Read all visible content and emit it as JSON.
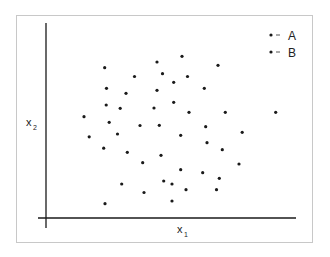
{
  "chart_data": {
    "type": "scatter",
    "title": "",
    "xlabel": "x",
    "xlabel_sub": "1",
    "ylabel": "x",
    "ylabel_sub": "2",
    "grid": false,
    "legend_position": "top-right",
    "legend": [
      {
        "label": "A",
        "marker": "dot",
        "line": "dash"
      },
      {
        "label": "B",
        "marker": "dot",
        "line": "dash"
      }
    ],
    "axes": {
      "x_ticks": [],
      "y_ticks": []
    },
    "note": "Coordinates in pixel space of the 330x257 image (x right, y down); axes carry no tick labels.",
    "points": [
      [
        104.7,
        67.7
      ],
      [
        134.5,
        76.5
      ],
      [
        157,
        62
      ],
      [
        182,
        56.3
      ],
      [
        218,
        65.3
      ],
      [
        162.5,
        73.7
      ],
      [
        187.5,
        76.5
      ],
      [
        173.7,
        82.3
      ],
      [
        106.5,
        88.3
      ],
      [
        126,
        93.3
      ],
      [
        157,
        90.3
      ],
      [
        204.3,
        88.3
      ],
      [
        106.2,
        105
      ],
      [
        120.2,
        108.3
      ],
      [
        154,
        108
      ],
      [
        173.7,
        102.3
      ],
      [
        189,
        112.3
      ],
      [
        225.3,
        112.3
      ],
      [
        275.7,
        112.3
      ],
      [
        84,
        116.7
      ],
      [
        109.2,
        122.3
      ],
      [
        140,
        125.5
      ],
      [
        159.3,
        125.3
      ],
      [
        205.7,
        126.7
      ],
      [
        117.5,
        134
      ],
      [
        89.2,
        136.8
      ],
      [
        180.7,
        135.3
      ],
      [
        242.2,
        132.3
      ],
      [
        207,
        142.7
      ],
      [
        103.7,
        148.2
      ],
      [
        127.3,
        152.3
      ],
      [
        161,
        155.3
      ],
      [
        222.3,
        149.7
      ],
      [
        142.7,
        162.7
      ],
      [
        239,
        164
      ],
      [
        180.7,
        169.7
      ],
      [
        202.7,
        172.7
      ],
      [
        219.3,
        178.3
      ],
      [
        121.7,
        184
      ],
      [
        163.7,
        181
      ],
      [
        172,
        184
      ],
      [
        144,
        192.5
      ],
      [
        186,
        189.7
      ],
      [
        216.5,
        189.7
      ],
      [
        105,
        203.7
      ],
      [
        172,
        201
      ]
    ]
  },
  "colors": {
    "point": "#1a1a1a",
    "axis": "#1a1a1a",
    "frame": "#c8c8c8",
    "background": "#ffffff"
  }
}
